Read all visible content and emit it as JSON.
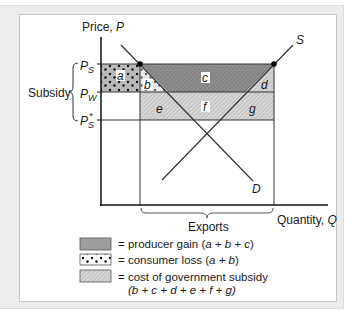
{
  "axes": {
    "y_label": "Price, ",
    "y_var": "P",
    "x_label": "Quantity, ",
    "x_var": "Q"
  },
  "price_levels": {
    "ps": {
      "main": "P",
      "sub": "S"
    },
    "pw": {
      "main": "P",
      "sub": "W"
    },
    "ps_star": {
      "main": "P",
      "sub": "S",
      "sup": "*"
    }
  },
  "subsidy_label": "Subsidy",
  "curves": {
    "supply": "S",
    "demand": "D"
  },
  "areas": {
    "a": "a",
    "b": "b",
    "c": "c",
    "d": "d",
    "e": "e",
    "f": "f",
    "g": "g"
  },
  "exports_label": "Exports",
  "legend": [
    {
      "key": "producer",
      "text": "= producer gain (",
      "formula": "a + b + c",
      "close": ")"
    },
    {
      "key": "consumer",
      "text": "= consumer loss (",
      "formula": "a + b",
      "close": ")"
    },
    {
      "key": "subsidy",
      "text": "= cost of government subsidy",
      "formula_line": "(b + c + d + e + f + g)"
    }
  ],
  "colors": {
    "producer_fill": "#8e8e8e",
    "subsidy_fill": "#d0d0d0",
    "consumer_fill": "#b9b9b9",
    "line": "#333333",
    "axis": "#111111"
  }
}
